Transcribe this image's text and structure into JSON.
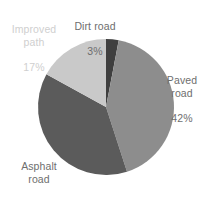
{
  "chart_data": {
    "type": "pie",
    "title": "",
    "subtitle": "",
    "xlabel": "",
    "ylabel": "",
    "grid": false,
    "legend": "none",
    "labels_inline": true,
    "start_angle_deg": 0,
    "direction": "clockwise",
    "categories": [
      "Dirt road",
      "Paved road",
      "Asphalt road",
      "Improved path"
    ],
    "values": [
      3,
      42,
      38,
      17
    ],
    "value_unit": "%",
    "slices": [
      {
        "name": "Dirt road",
        "value": 3,
        "value_text": "3%",
        "color": "#3f3f3f",
        "label_name": "Dirt road",
        "label_position": "top"
      },
      {
        "name": "Paved road",
        "value": 42,
        "value_text": "42%",
        "color": "#8d8d8d",
        "label_name": "Paved\nroad",
        "label_position": "right"
      },
      {
        "name": "Asphalt road",
        "value": 38,
        "value_text": "38%",
        "color": "#5b5b5b",
        "label_name": "Asphalt\nroad",
        "label_position": "bottom-left"
      },
      {
        "name": "Improved path",
        "value": 17,
        "value_text": "17%",
        "color": "#c9c9c9",
        "label_name": "Improved\npath",
        "label_position": "top-left"
      }
    ]
  },
  "labels": {
    "improved_path": {
      "name": "Improved\npath",
      "value": "17%"
    },
    "dirt_road": {
      "name": "Dirt road",
      "value": "3%"
    },
    "paved_road": {
      "name": "Paved\nroad",
      "value": "42%"
    },
    "asphalt_road": {
      "name": "Asphalt\nroad",
      "value": "38%"
    }
  },
  "colors": {
    "background": "#ffffff",
    "text": "#6e6e6e",
    "text_faint": "#cfcfcf",
    "dirt_road": "#3f3f3f",
    "paved_road": "#8d8d8d",
    "asphalt_road": "#5b5b5b",
    "improved_path": "#c9c9c9"
  },
  "geometry": {
    "center_x": 106,
    "center_y": 107,
    "radius": 68
  }
}
